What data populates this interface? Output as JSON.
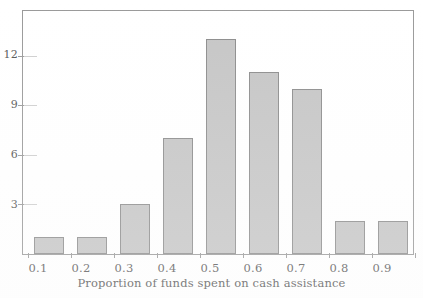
{
  "chart_data": {
    "type": "bar",
    "title": "",
    "subtitle": "",
    "xlabel": "Proportion of funds spent on cash assistance",
    "ylabel": "",
    "categories": [
      "0.1",
      "0.2",
      "0.3",
      "0.4",
      "0.5",
      "0.6",
      "0.7",
      "0.8",
      "0.9"
    ],
    "values": [
      1,
      1,
      3,
      7,
      13,
      11,
      10,
      2,
      2
    ],
    "xtick_labels": [
      "0.1",
      "0.2",
      "0.3",
      "0.4",
      "0.5",
      "0.6",
      "0.7",
      "0.8",
      "0.9"
    ],
    "ytick_labels": [
      "3",
      "6",
      "9",
      "12"
    ],
    "ytick_values": [
      3,
      6,
      9,
      12
    ],
    "ylim": [
      0,
      14.7
    ],
    "grid": false,
    "legend": false,
    "legend_position": "none",
    "annotations": []
  },
  "style": {
    "bar_fill": "#c6c6c6",
    "bar_border": "#8d8d8d",
    "frame_color": "#9a9a9a",
    "text_color": "#5a5a5a",
    "background": "#ffffff"
  }
}
